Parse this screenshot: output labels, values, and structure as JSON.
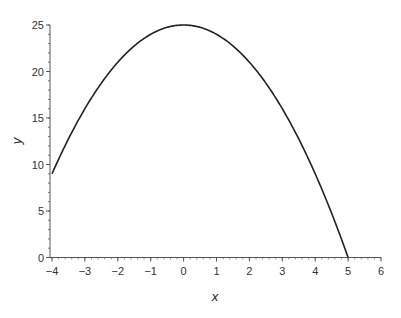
{
  "chart_data": {
    "type": "line",
    "title": "",
    "xlabel": "x",
    "ylabel": "y",
    "xlim": [
      -4,
      6
    ],
    "ylim": [
      0,
      25
    ],
    "x_ticks": [
      -4,
      -3,
      -2,
      -1,
      0,
      1,
      2,
      3,
      4,
      5,
      6
    ],
    "x_tick_labels": [
      "−4",
      "−3",
      "−2",
      "−1",
      "0",
      "1",
      "2",
      "3",
      "4",
      "5",
      "6"
    ],
    "y_ticks": [
      0,
      5,
      10,
      15,
      20,
      25
    ],
    "y_tick_labels": [
      "0",
      "5",
      "10",
      "15",
      "20",
      "25"
    ],
    "grid": false,
    "legend": null,
    "series": [
      {
        "name": "y = 25 - x^2",
        "color": "#222222",
        "x": [
          -4,
          -3.5,
          -3,
          -2.5,
          -2,
          -1.5,
          -1,
          -0.5,
          0,
          0.5,
          1,
          1.5,
          2,
          2.5,
          3,
          3.5,
          4,
          4.5,
          5
        ],
        "y": [
          9,
          12.75,
          16,
          18.75,
          21,
          22.75,
          24,
          24.75,
          25,
          24.75,
          24,
          22.75,
          21,
          18.75,
          16,
          12.75,
          9,
          4.75,
          0
        ]
      }
    ]
  }
}
